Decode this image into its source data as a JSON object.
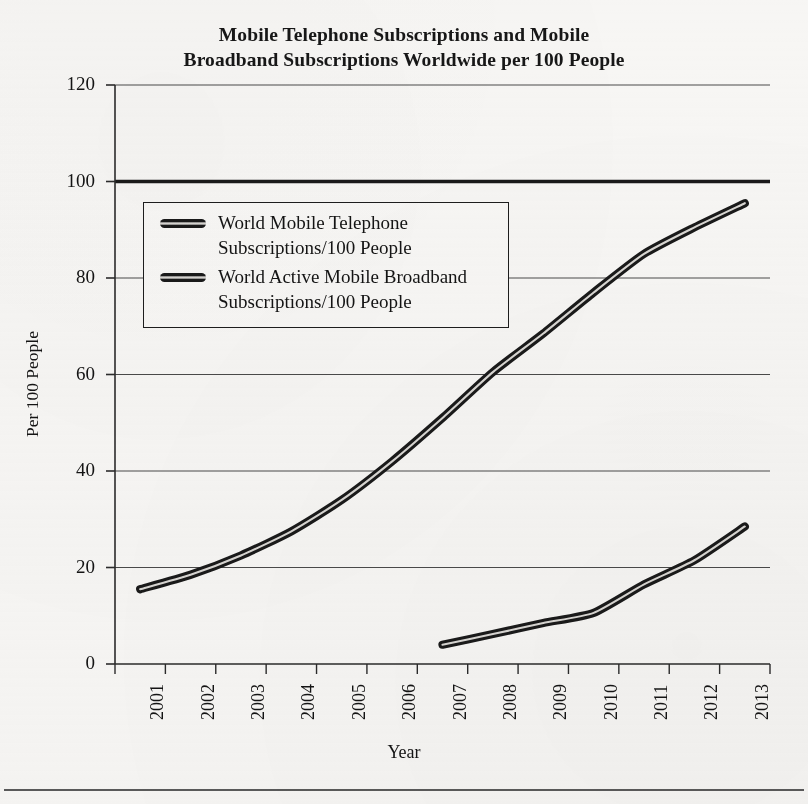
{
  "figure": {
    "title_line1": "Mobile Telephone Subscriptions and Mobile",
    "title_line2": "Broadband Subscriptions Worldwide per 100 People"
  },
  "axes": {
    "ylabel": "Per 100 People",
    "xlabel": "Year",
    "ytick_labels": [
      "120",
      "100",
      "80",
      "60",
      "40",
      "20",
      "0"
    ],
    "xtick_labels": [
      "2001",
      "2002",
      "2003",
      "2004",
      "2005",
      "2006",
      "2007",
      "2008",
      "2009",
      "2010",
      "2011",
      "2012",
      "2013"
    ]
  },
  "legend": {
    "items": [
      {
        "line1": "World Mobile Telephone",
        "line2": "Subscriptions/100 People"
      },
      {
        "line1": "World Active Mobile Broadband",
        "line2": "Subscriptions/100 People"
      }
    ]
  },
  "colors": {
    "line": "#1a1a1a",
    "line_highlight": "#d9d7d3",
    "grid": "#3a3a3a",
    "axis": "#2b2b2b",
    "background": "#f7f6f4"
  },
  "chart_data": {
    "type": "line",
    "title": "Mobile Telephone Subscriptions and Mobile Broadband Subscriptions Worldwide per 100 People",
    "xlabel": "Year",
    "ylabel": "Per 100 People",
    "categories": [
      "2001",
      "2002",
      "2003",
      "2004",
      "2005",
      "2006",
      "2007",
      "2008",
      "2009",
      "2010",
      "2011",
      "2012",
      "2013"
    ],
    "ylim": [
      0,
      120
    ],
    "yticks": [
      0,
      20,
      40,
      60,
      80,
      100,
      120
    ],
    "grid": true,
    "legend_position": "upper left",
    "reference_line": {
      "value": 100,
      "style": "thick"
    },
    "series": [
      {
        "name": "World Mobile Telephone Subscriptions/100 People",
        "values": [
          15.5,
          18.5,
          22.5,
          27.5,
          34.0,
          42.0,
          51.0,
          60.5,
          68.5,
          77.0,
          85.0,
          90.5,
          95.5
        ]
      },
      {
        "name": "World Active Mobile Broadband Subscriptions/100 People",
        "values": [
          null,
          null,
          null,
          null,
          null,
          null,
          4.0,
          6.2,
          8.5,
          10.6,
          16.5,
          21.5,
          28.5
        ]
      }
    ]
  }
}
